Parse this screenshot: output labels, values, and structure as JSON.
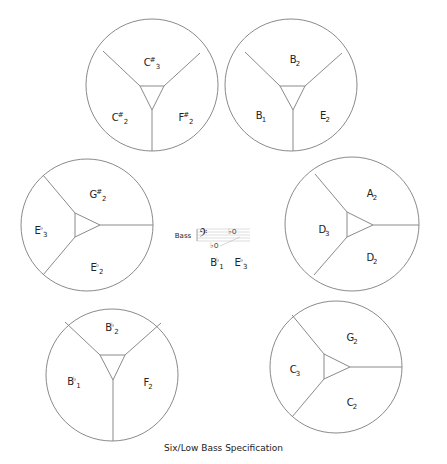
{
  "caption": "Six/Low Bass Specification",
  "center": {
    "clef_label": "Bass",
    "notes": [
      {
        "letter": "B",
        "accidental": "♭",
        "octave": "1"
      },
      {
        "letter": "E",
        "accidental": "♭",
        "octave": "3"
      }
    ]
  },
  "circles": [
    {
      "id": "top-left",
      "labels": [
        {
          "letter": "C",
          "acc": "#",
          "oct": "3"
        },
        {
          "letter": "C",
          "acc": "#",
          "oct": "2"
        },
        {
          "letter": "F",
          "acc": "#",
          "oct": "2"
        }
      ]
    },
    {
      "id": "top-right",
      "labels": [
        {
          "letter": "B",
          "acc": "",
          "oct": "2"
        },
        {
          "letter": "B",
          "acc": "",
          "oct": "1"
        },
        {
          "letter": "E",
          "acc": "",
          "oct": "2"
        }
      ]
    },
    {
      "id": "mid-left",
      "labels": [
        {
          "letter": "G",
          "acc": "#",
          "oct": "2"
        },
        {
          "letter": "E",
          "acc": "♭",
          "oct": "3"
        },
        {
          "letter": "E",
          "acc": "♭",
          "oct": "2"
        }
      ]
    },
    {
      "id": "mid-right",
      "labels": [
        {
          "letter": "A",
          "acc": "",
          "oct": "2"
        },
        {
          "letter": "D",
          "acc": "",
          "oct": "3"
        },
        {
          "letter": "D",
          "acc": "",
          "oct": "2"
        }
      ]
    },
    {
      "id": "bottom-left",
      "labels": [
        {
          "letter": "B",
          "acc": "♭",
          "oct": "2"
        },
        {
          "letter": "B",
          "acc": "♭",
          "oct": "1"
        },
        {
          "letter": "F",
          "acc": "",
          "oct": "2"
        }
      ]
    },
    {
      "id": "bottom-right",
      "labels": [
        {
          "letter": "G",
          "acc": "",
          "oct": "2"
        },
        {
          "letter": "C",
          "acc": "",
          "oct": "3"
        },
        {
          "letter": "C",
          "acc": "",
          "oct": "2"
        }
      ]
    }
  ]
}
